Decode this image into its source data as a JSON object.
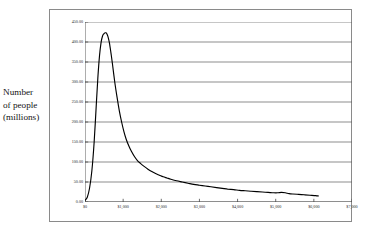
{
  "chart": {
    "title": "WORLD INCOME DISTRIBUTION",
    "axis_caption_lines": [
      "Number",
      "of people",
      "(millions)"
    ]
  },
  "chart_data": {
    "type": "line",
    "title": "WORLD INCOME DISTRIBUTION",
    "xlabel": "",
    "ylabel": "Number of people (millions)",
    "xlim": [
      0,
      7000
    ],
    "ylim": [
      0,
      450
    ],
    "grid": true,
    "legend": null,
    "line_color": "#000000",
    "xticks": [
      0,
      1000,
      2000,
      3000,
      4000,
      5000,
      6000,
      7000
    ],
    "xtick_labels": [
      "$0",
      "$1,000",
      "$2,000",
      "$3,000",
      "$4,000",
      "$5,000",
      "$6,000",
      "$7,000"
    ],
    "yticks": [
      0,
      50,
      100,
      150,
      200,
      250,
      300,
      350,
      400,
      450
    ],
    "ytick_labels": [
      "0.00",
      "50.00",
      "100.00",
      "150.00",
      "200.00",
      "250.00",
      "300.00",
      "350.00",
      "400.00",
      "450.00"
    ],
    "x": [
      0,
      60,
      120,
      180,
      240,
      300,
      340,
      380,
      420,
      460,
      500,
      530,
      550,
      570,
      600,
      640,
      680,
      720,
      780,
      840,
      900,
      960,
      1020,
      1080,
      1150,
      1220,
      1300,
      1380,
      1460,
      1550,
      1650,
      1750,
      1850,
      1950,
      2050,
      2150,
      2250,
      2400,
      2550,
      2700,
      2850,
      3000,
      3150,
      3300,
      3450,
      3600,
      3750,
      3900,
      4050,
      4200,
      4350,
      4500,
      4650,
      4800,
      4950,
      5050,
      5150,
      5250,
      5350,
      5450,
      5600,
      5750,
      5900,
      6050,
      6120
    ],
    "y": [
      4,
      12,
      35,
      78,
      150,
      250,
      315,
      365,
      398,
      415,
      421,
      423,
      423,
      421,
      414,
      398,
      373,
      345,
      300,
      262,
      228,
      200,
      176,
      157,
      140,
      126,
      113,
      103,
      96,
      89,
      82,
      76,
      71,
      67,
      63,
      60,
      57,
      53,
      50,
      47,
      44,
      42,
      40,
      38,
      36,
      34,
      32,
      31,
      29,
      28,
      27,
      26,
      25,
      24,
      23,
      23,
      24,
      23,
      21,
      20,
      19,
      18,
      17,
      16,
      15
    ]
  }
}
